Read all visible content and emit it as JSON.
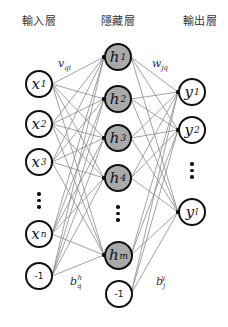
{
  "layers": {
    "input": {
      "title": "輸入層",
      "center_x": 39,
      "nodes": [
        {
          "id": "x1",
          "symbol": "x",
          "sub": "1",
          "y": 84
        },
        {
          "id": "x2",
          "symbol": "x",
          "sub": "2",
          "y": 124
        },
        {
          "id": "x3",
          "symbol": "x",
          "sub": "3",
          "y": 162
        },
        {
          "id": "xn",
          "symbol": "x",
          "sub": "n",
          "y": 234
        }
      ],
      "bias": {
        "label": "-1",
        "y": 276
      },
      "ellipsis_y": 194
    },
    "hidden": {
      "title": "隱藏層",
      "center_x": 118,
      "nodes": [
        {
          "id": "h1",
          "symbol": "h",
          "sub": "1",
          "y": 57
        },
        {
          "id": "h2",
          "symbol": "h",
          "sub": "2",
          "y": 99
        },
        {
          "id": "h3",
          "symbol": "h",
          "sub": "3",
          "y": 138
        },
        {
          "id": "h4",
          "symbol": "h",
          "sub": "4",
          "y": 178
        },
        {
          "id": "hm",
          "symbol": "h",
          "sub": "m",
          "y": 255
        }
      ],
      "bias": {
        "label": "-1",
        "y": 294
      },
      "ellipsis_y": 206
    },
    "output": {
      "title": "輸出層",
      "center_x": 192,
      "nodes": [
        {
          "id": "y1",
          "symbol": "y",
          "sub": "1",
          "y": 92
        },
        {
          "id": "y2",
          "symbol": "y",
          "sub": "2",
          "y": 130
        },
        {
          "id": "yl",
          "symbol": "y",
          "sub": "l",
          "y": 212
        }
      ],
      "ellipsis_y": 164
    }
  },
  "weight_labels": {
    "input_hidden": {
      "symbol": "v",
      "sub": "qi"
    },
    "hidden_output": {
      "symbol": "w",
      "sub": "jq"
    },
    "hidden_bias": {
      "symbol": "b",
      "sub": "q",
      "sup": "h"
    },
    "output_bias": {
      "symbol": "b",
      "sub": "j",
      "sup": "y"
    }
  },
  "colors": {
    "hidden_fill": "#a9a9a9",
    "node_stroke": "#111111",
    "edge": "#8a8a8a"
  }
}
